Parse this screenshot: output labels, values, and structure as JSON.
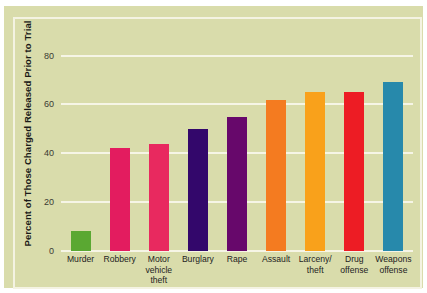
{
  "chart_data": {
    "type": "bar",
    "title": "",
    "subtitle": "",
    "xlabel": "",
    "ylabel": "Percent of Those Charged Released Prior to Trial",
    "categories": [
      "Murder",
      "Robbery",
      "Motor vehicle theft",
      "Burglary",
      "Rape",
      "Assault",
      "Larceny/ theft",
      "Drug offense",
      "Weapons offense"
    ],
    "category_lines": [
      [
        "Murder"
      ],
      [
        "Robbery"
      ],
      [
        "Motor",
        "vehicle",
        "theft"
      ],
      [
        "Burglary"
      ],
      [
        "Rape"
      ],
      [
        "Assault"
      ],
      [
        "Larceny/",
        "theft"
      ],
      [
        "Drug",
        "offense"
      ],
      [
        "Weapons",
        "offense"
      ]
    ],
    "values": [
      8,
      42,
      44,
      50,
      55,
      62,
      65,
      65,
      69
    ],
    "bar_colors": [
      "#5aa832",
      "#e31c5f",
      "#e8295f",
      "#33076b",
      "#67086b",
      "#f47b20",
      "#f9a11b",
      "#ed1c24",
      "#2789ab"
    ],
    "ylim": [
      0,
      88
    ],
    "yticks": [
      0,
      20,
      40,
      60,
      80
    ],
    "ytick_labels": [
      "0",
      "20",
      "40",
      "60",
      "80"
    ],
    "grid": true,
    "grid_color": "#f6f5e6",
    "legend": "none",
    "background_color": "#d9dcab",
    "frame_color": "#f4f3e2",
    "axis_text_color": "#23231e"
  }
}
